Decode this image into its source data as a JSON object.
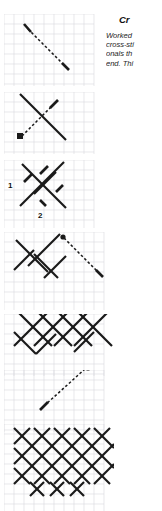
{
  "page": {
    "width": 162,
    "height": 511,
    "background": "#ffffff",
    "grid_color": "#d9d9de",
    "ink_color": "#1a1a1a"
  },
  "article": {
    "heading": "Cr",
    "heading_full_visible": "Cr",
    "body_lines": [
      "Worked",
      "cross-sti",
      "onals th",
      "end. Thi"
    ]
  },
  "figure": {
    "caption_labels": [
      "1",
      "2"
    ],
    "panels": [
      {
        "name": "panel-1-single-diagonal",
        "step": 1,
        "description": "single dashed diagonal stitch running from upper-left to lower-right with solid nubs at both ends",
        "rows": 7,
        "cols": 9
      },
      {
        "name": "panel-2-first-cross",
        "step": 2,
        "description": "solid descending diagonal crossed by a dashed ascending thread travel line",
        "rows": 6,
        "cols": 9
      },
      {
        "name": "panel-3-numbered-cross",
        "step": 3,
        "description": "completed cross stitch with numbered entry point 1 and exit point 2 and four directional arrow nubs",
        "rows": 6,
        "cols": 9,
        "labels": [
          {
            "text": "1",
            "meaning": "needle-entry-point"
          },
          {
            "text": "2",
            "meaning": "needle-exit-point"
          }
        ]
      },
      {
        "name": "panel-4-row-of-crosses",
        "step": 4,
        "description": "partial row of crosses with a long dashed return travel line descending to the right",
        "rows": 7,
        "cols": 10
      },
      {
        "name": "panel-5-lattice-row",
        "step": 5,
        "description": "continuous lattice of completed crosses forming a zig-zag band",
        "rows": 7,
        "cols": 10
      },
      {
        "name": "panel-6-return-journey",
        "step": 6,
        "description": "lattice band with a dashed diagonal return stitch heading back down-left",
        "rows": 7,
        "cols": 10
      },
      {
        "name": "panel-7-finished-lattice",
        "step": 7,
        "description": "finished dense diamond lattice of crossed stitches filling the grid",
        "rows": 11,
        "cols": 10
      }
    ]
  }
}
